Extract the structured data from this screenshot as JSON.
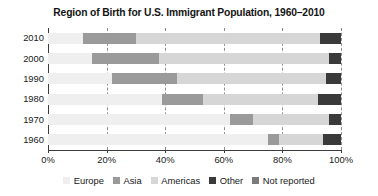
{
  "chart_data": {
    "type": "bar",
    "orientation": "horizontal",
    "stacked": true,
    "title": "Region of Birth for U.S. Immigrant Population, 1960–2010",
    "xlabel": "",
    "ylabel": "",
    "categories": [
      "2010",
      "2000",
      "1990",
      "1980",
      "1970",
      "1960"
    ],
    "xlim": [
      0,
      100
    ],
    "xticks": [
      0,
      20,
      40,
      60,
      80,
      100
    ],
    "xticklabels": [
      "0%",
      "20%",
      "40%",
      "60%",
      "80%",
      "100%"
    ],
    "grid": "vertical-dashed",
    "legend_position": "bottom",
    "series": [
      {
        "name": "Europe",
        "color": "#efefef",
        "values": [
          12,
          15,
          22,
          39,
          62,
          75
        ]
      },
      {
        "name": "Asia",
        "color": "#9a9a9a",
        "values": [
          18,
          23,
          22,
          14,
          8,
          4
        ]
      },
      {
        "name": "Americas",
        "color": "#d6d6d6",
        "values": [
          63,
          58,
          51,
          39,
          26,
          15
        ]
      },
      {
        "name": "Other",
        "color": "#3a3a3a",
        "values": [
          7,
          4,
          5,
          8,
          4,
          6
        ]
      },
      {
        "name": "Not reported",
        "color": "#7b7b7b",
        "values": [
          0,
          0,
          0,
          0,
          0,
          0
        ]
      }
    ]
  },
  "axis": {
    "y_tick_labels": [
      "2010",
      "2000",
      "1990",
      "1980",
      "1970",
      "1960"
    ],
    "x_tick_labels": [
      "0%",
      "20%",
      "40%",
      "60%",
      "80%",
      "100%"
    ]
  },
  "legend": {
    "items": [
      {
        "label": "Europe",
        "color": "#efefef"
      },
      {
        "label": "Asia",
        "color": "#9a9a9a"
      },
      {
        "label": "Americas",
        "color": "#d6d6d6"
      },
      {
        "label": "Other",
        "color": "#3a3a3a"
      },
      {
        "label": "Not reported",
        "color": "#7b7b7b"
      }
    ]
  },
  "colors": {
    "axis": "#3c3c3c",
    "grid": "#8e8e8e",
    "text": "#202020",
    "title": "#141414",
    "background": "#ffffff"
  }
}
